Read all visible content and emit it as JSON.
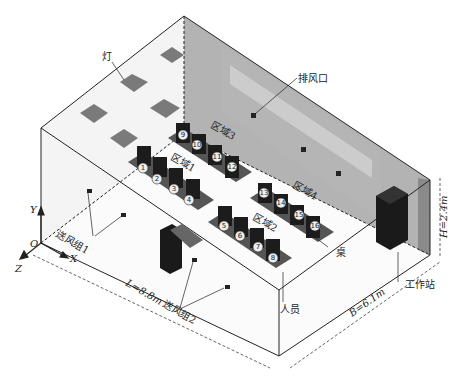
{
  "diagram": {
    "type": "isometric room layout",
    "labels": {
      "lamp": "灯",
      "exhaust": "排风口",
      "zone1": "区域1",
      "zone2": "区域2",
      "zone3": "区域3",
      "zone4": "区域4",
      "desk": "桌",
      "workstation": "工作站",
      "person": "人员",
      "supply1": "送风组1",
      "supply2": "送风组2"
    },
    "axes": {
      "x": "X",
      "y": "Y",
      "z": "Z",
      "origin": "O"
    },
    "dimensions": {
      "length": "L=8.8m",
      "width": "B=6.1m",
      "height": "H=2.4m"
    },
    "occupants": [
      "1",
      "2",
      "3",
      "4",
      "5",
      "6",
      "7",
      "8",
      "9",
      "10",
      "11",
      "12",
      "13",
      "14",
      "15",
      "16"
    ],
    "colors": {
      "wall_gray": "#8a8a8a",
      "lamp": "#7a7a7a",
      "occupant": "#1c1c1c",
      "desk": "#555555",
      "line": "#222222"
    }
  }
}
